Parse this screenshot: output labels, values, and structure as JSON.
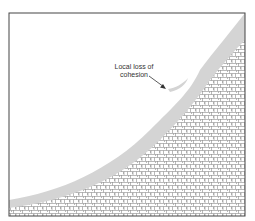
{
  "diagram": {
    "annotation": {
      "line1": "Local loss of",
      "line2": "cohesion"
    },
    "colors": {
      "frame": "#444444",
      "soil_layer": "#d4d4d4",
      "rock_hatch": "#8a8a8a",
      "background": "#ffffff"
    }
  }
}
